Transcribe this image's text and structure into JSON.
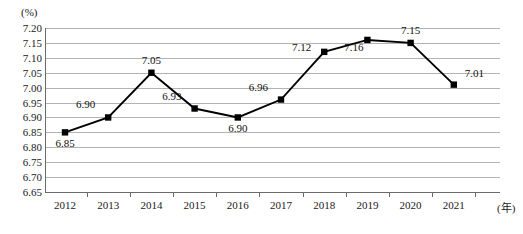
{
  "chart_data": {
    "type": "line",
    "title": "",
    "xlabel": "(年)",
    "ylabel": "(%)",
    "categories": [
      "2012",
      "2013",
      "2014",
      "2015",
      "2016",
      "2017",
      "2018",
      "2019",
      "2020",
      "2021"
    ],
    "values": [
      6.85,
      6.9,
      7.05,
      6.93,
      6.9,
      6.96,
      7.12,
      7.16,
      7.15,
      7.01
    ],
    "point_labels": [
      "6.85",
      "6.90",
      "7.05",
      "6.93",
      "6.90",
      "6.96",
      "7.12",
      "7.16",
      "7.15",
      "7.01"
    ],
    "ylim": [
      6.65,
      7.2
    ],
    "y_ticks": [
      "7.20",
      "7.15",
      "7.10",
      "7.05",
      "7.00",
      "6.95",
      "6.90",
      "6.85",
      "6.80",
      "6.75",
      "6.70",
      "6.65"
    ],
    "y_tick_values": [
      7.2,
      7.15,
      7.1,
      7.05,
      7.0,
      6.95,
      6.9,
      6.85,
      6.8,
      6.75,
      6.7,
      6.65
    ],
    "grid": true,
    "legend": "none",
    "marker": "square",
    "series_color": "#000000",
    "grid_color": "#b3b3b3",
    "axis_color": "#6b6b6b",
    "label_positions": [
      "below",
      "above-left",
      "above",
      "above-left",
      "below",
      "above-left",
      "left",
      "below-left",
      "above",
      "above-right"
    ]
  },
  "axis": {
    "unit_y": "(%)",
    "unit_x": "(年)"
  }
}
